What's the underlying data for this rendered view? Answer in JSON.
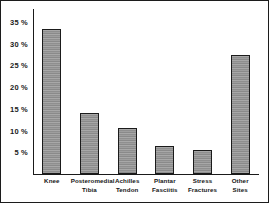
{
  "chart_data": {
    "type": "bar",
    "title": "",
    "subtitle": "",
    "xlabel": "",
    "ylabel": "",
    "categories": [
      "Knee",
      "Posteromedial Tibia",
      "Achilles Tendon",
      "Plantar Fasciitis",
      "Stress Fractures",
      "Other Sites"
    ],
    "category_lines": [
      [
        "Knee"
      ],
      [
        "Posteromedial",
        "Tibia"
      ],
      [
        "Achilles",
        "Tendon"
      ],
      [
        "Plantar",
        "Fasciitis"
      ],
      [
        "Stress",
        "Fractures"
      ],
      [
        "Other",
        "Sites"
      ]
    ],
    "values": [
      33.5,
      14.0,
      10.5,
      6.5,
      5.5,
      27.5
    ],
    "value_labels": [
      "33.5 %",
      "14 %",
      "10.5 %",
      "6.5 %",
      "5.5 %",
      "27.5 %"
    ],
    "ylim": [
      0,
      38
    ],
    "yticks": [
      5,
      10,
      15,
      20,
      25,
      30,
      35
    ],
    "ytick_labels": [
      "5 %",
      "10 %",
      "15 %",
      "20 %",
      "25 %",
      "30 %",
      "35 %"
    ],
    "grid": false,
    "legend": false,
    "legend_position": "none",
    "bar_color": "#9a9a9a",
    "bar_edge_color": "#1b1b1b",
    "axis_color": "#1a1a1a",
    "background_color": "#ffffff",
    "border_color": "#1c1c1c"
  }
}
